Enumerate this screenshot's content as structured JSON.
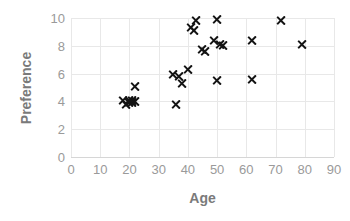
{
  "chart_data": {
    "type": "scatter",
    "title": "",
    "xlabel": "Age",
    "ylabel": "Preference",
    "xlim": [
      0,
      90
    ],
    "ylim": [
      0,
      10
    ],
    "xticks": [
      0,
      10,
      20,
      30,
      40,
      50,
      60,
      70,
      80,
      90
    ],
    "yticks": [
      0,
      2,
      4,
      6,
      8,
      10
    ],
    "grid": true,
    "legend": false,
    "marker": "x",
    "marker_color": "#141414",
    "series": [
      {
        "name": "Respondents",
        "points": [
          [
            18,
            4.1
          ],
          [
            19,
            3.8
          ],
          [
            20,
            3.9
          ],
          [
            20,
            4.1
          ],
          [
            21,
            3.9
          ],
          [
            21,
            4.1
          ],
          [
            22,
            4.0
          ],
          [
            22,
            5.1
          ],
          [
            35,
            5.9
          ],
          [
            36,
            3.8
          ],
          [
            37,
            5.8
          ],
          [
            38,
            5.3
          ],
          [
            40,
            6.3
          ],
          [
            41,
            9.3
          ],
          [
            42,
            9.1
          ],
          [
            43,
            9.8
          ],
          [
            45,
            7.7
          ],
          [
            46,
            7.6
          ],
          [
            49,
            8.4
          ],
          [
            50,
            9.9
          ],
          [
            50,
            5.5
          ],
          [
            51,
            8.1
          ],
          [
            52,
            8.0
          ],
          [
            62,
            8.4
          ],
          [
            62,
            5.6
          ],
          [
            72,
            9.8
          ],
          [
            79,
            8.1
          ]
        ]
      }
    ]
  },
  "axes": {
    "x_title": "Age",
    "y_title": "Preference",
    "x_tick_labels": [
      "0",
      "10",
      "20",
      "30",
      "40",
      "50",
      "60",
      "70",
      "80",
      "90"
    ],
    "y_tick_labels": [
      "0",
      "2",
      "4",
      "6",
      "8",
      "10"
    ]
  },
  "colors": {
    "marker": "#141414",
    "gridline": "#e8e8e8",
    "axis_line": "#d6d6d6",
    "tick_label": "#9a9a9a",
    "axis_title": "#7a7a7a",
    "background": "#ffffff"
  }
}
